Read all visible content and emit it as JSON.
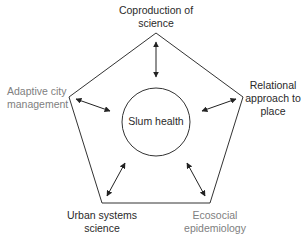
{
  "diagram": {
    "center": {
      "label": "Slum health"
    },
    "nodes": [
      {
        "id": "top",
        "line1": "Coproduction of",
        "line2": "science",
        "style": "dark"
      },
      {
        "id": "right",
        "line1": "Relational",
        "line2": "approach to",
        "line3": "place",
        "style": "dark"
      },
      {
        "id": "bottom-right",
        "line1": "Ecosocial",
        "line2": "epidemiology",
        "style": "grey"
      },
      {
        "id": "bottom-left",
        "line1": "Urban systems",
        "line2": "science",
        "style": "dark"
      },
      {
        "id": "left",
        "line1": "Adaptive city",
        "line2": "management",
        "style": "grey"
      }
    ],
    "edges": [
      {
        "from": "Slum health",
        "to": "Coproduction of science",
        "type": "bidirectional"
      },
      {
        "from": "Slum health",
        "to": "Relational approach to place",
        "type": "bidirectional"
      },
      {
        "from": "Slum health",
        "to": "Ecosocial epidemiology",
        "type": "bidirectional"
      },
      {
        "from": "Slum health",
        "to": "Urban systems science",
        "type": "bidirectional"
      },
      {
        "from": "Slum health",
        "to": "Adaptive city management",
        "type": "bidirectional"
      }
    ],
    "colors": {
      "line": "#333333",
      "dark_text": "#2a2a2a",
      "grey_text": "#808080"
    }
  }
}
